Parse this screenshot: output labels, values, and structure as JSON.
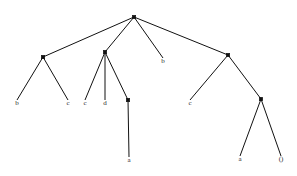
{
  "figure": {
    "type": "syntax-tree-diagram",
    "width": 297,
    "height": 176,
    "background_color": "#ffffff",
    "line_color": "#111111",
    "label_color": "#2b2b2b"
  },
  "tree": {
    "nodes": [
      {
        "id": "root",
        "x": 134,
        "y": 17,
        "kind": "internal",
        "label": ""
      },
      {
        "id": "n1",
        "x": 43,
        "y": 57,
        "kind": "internal",
        "label": ""
      },
      {
        "id": "n2",
        "x": 105,
        "y": 52,
        "kind": "internal",
        "label": ""
      },
      {
        "id": "n3",
        "x": 128,
        "y": 100,
        "kind": "internal",
        "label": ""
      },
      {
        "id": "n4",
        "x": 228,
        "y": 55,
        "kind": "internal",
        "label": ""
      },
      {
        "id": "n5",
        "x": 261,
        "y": 99,
        "kind": "internal",
        "label": ""
      },
      {
        "id": "l_b1",
        "x": 17,
        "y": 100,
        "kind": "leaf",
        "label": "b"
      },
      {
        "id": "l_c1",
        "x": 68,
        "y": 100,
        "kind": "leaf",
        "label": "c"
      },
      {
        "id": "l_c2",
        "x": 85,
        "y": 100,
        "kind": "leaf",
        "label": "c"
      },
      {
        "id": "l_d1",
        "x": 105,
        "y": 100,
        "kind": "leaf",
        "label": "d"
      },
      {
        "id": "l_a1",
        "x": 129,
        "y": 157,
        "kind": "leaf",
        "label": "a"
      },
      {
        "id": "l_b2",
        "x": 163,
        "y": 58,
        "kind": "leaf",
        "label": "b"
      },
      {
        "id": "l_c3",
        "x": 190,
        "y": 100,
        "kind": "leaf",
        "label": "c"
      },
      {
        "id": "l_a2",
        "x": 240,
        "y": 156,
        "kind": "leaf",
        "label": "a"
      },
      {
        "id": "l_p1",
        "x": 281,
        "y": 156,
        "kind": "leaf",
        "label": "()"
      }
    ],
    "edges": [
      {
        "from": "root",
        "to": "n1"
      },
      {
        "from": "root",
        "to": "n2"
      },
      {
        "from": "root",
        "to": "l_b2"
      },
      {
        "from": "root",
        "to": "n4"
      },
      {
        "from": "n1",
        "to": "l_b1"
      },
      {
        "from": "n1",
        "to": "l_c1"
      },
      {
        "from": "n2",
        "to": "l_c2"
      },
      {
        "from": "n2",
        "to": "l_d1"
      },
      {
        "from": "n2",
        "to": "n3"
      },
      {
        "from": "n3",
        "to": "l_a1"
      },
      {
        "from": "n4",
        "to": "l_c3"
      },
      {
        "from": "n4",
        "to": "n5"
      },
      {
        "from": "n5",
        "to": "l_a2"
      },
      {
        "from": "n5",
        "to": "l_p1"
      }
    ],
    "label_offset_y": 5,
    "dot_radius": 1.7
  }
}
